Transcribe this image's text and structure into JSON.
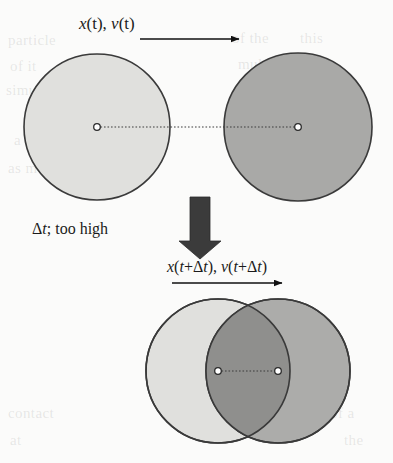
{
  "figure": {
    "title": "",
    "labels": {
      "top": "x(t), v(t)",
      "middle": "Δt; too high",
      "bottom": "x(t+Δt), v(t+Δt)"
    },
    "label_parts": {
      "top_x": "x",
      "top_x_arg": "(t),",
      "top_v": "v",
      "top_v_arg": "(t)",
      "mid_delta": "Δ",
      "mid_t": "t",
      "mid_rest": "; too high",
      "bot_x": "x",
      "bot_x_arg1": "(",
      "bot_x_t1": "t",
      "bot_x_plus": "+Δ",
      "bot_x_t2": "t",
      "bot_x_close": "),",
      "bot_v": "v",
      "bot_v_arg1": "(",
      "bot_v_t1": "t",
      "bot_v_plus": "+Δ",
      "bot_v_t2": "t",
      "bot_v_close": ")"
    }
  },
  "colors": {
    "light_circle_fill": "#e0e0dd",
    "dark_circle_fill": "#a9a9a7",
    "overlap_fill": "#8f8f8d",
    "circle_stroke": "#3a3a3a",
    "center_dot_fill": "#ffffff",
    "center_dot_stroke": "#2b2b2b",
    "connector_line": "#3c3c3c",
    "arrow_black": "#111111",
    "arrow_block": "#3b3b3b",
    "page_background": "#fbfbfa",
    "text": "#1b1b1b"
  },
  "geometry": {
    "top_row": {
      "light_circle": {
        "cx": 97,
        "cy": 127,
        "r": 73
      },
      "dark_circle": {
        "cx": 298,
        "cy": 127,
        "r": 74
      },
      "connector_from_x": 97,
      "connector_to_x": 298,
      "connector_y": 127
    },
    "bottom_row": {
      "light_circle": {
        "cx": 218,
        "cy": 371,
        "r": 72
      },
      "dark_circle": {
        "cx": 278,
        "cy": 371,
        "r": 72
      },
      "connector_from_x": 218,
      "connector_to_x": 278,
      "connector_y": 371
    },
    "velocity_arrow_top": {
      "x1": 140,
      "x2": 240,
      "y": 39
    },
    "velocity_arrow_bottom": {
      "x1": 172,
      "x2": 283,
      "y": 283
    },
    "timestep_arrow": {
      "x": 200,
      "y_top": 197,
      "y_bottom": 259,
      "shaft_width": 20
    }
  },
  "icons": {
    "velocity_arrow": "arrow-right-icon",
    "timestep_arrow": "arrow-down-block-icon",
    "center_marker": "center-dot-icon"
  },
  "bleed_text": {
    "lines": [
      {
        "text": "particle",
        "x": 8,
        "y": 32
      },
      {
        "text": "of the",
        "x": 232,
        "y": 30
      },
      {
        "text": "this",
        "x": 300,
        "y": 30
      },
      {
        "text": "of it",
        "x": 10,
        "y": 58
      },
      {
        "text": "multiple",
        "x": 238,
        "y": 56
      },
      {
        "text": "simulation",
        "x": 6,
        "y": 82
      },
      {
        "text": "contact",
        "x": 252,
        "y": 80
      },
      {
        "text": "a",
        "x": 14,
        "y": 132
      },
      {
        "text": "overlap",
        "x": 246,
        "y": 132
      },
      {
        "text": "as more",
        "x": 8,
        "y": 160
      },
      {
        "text": "the time",
        "x": 240,
        "y": 160
      },
      {
        "text": "contact",
        "x": 8,
        "y": 405
      },
      {
        "text": "of a",
        "x": 330,
        "y": 405
      },
      {
        "text": "at",
        "x": 10,
        "y": 432
      },
      {
        "text": "the",
        "x": 344,
        "y": 432
      }
    ]
  }
}
